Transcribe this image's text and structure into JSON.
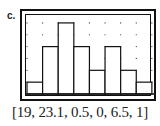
{
  "label": "c.",
  "window_caption": "[19, 23.1, 0.5, 0, 6.5, 1]",
  "chart_data": {
    "type": "bar",
    "subtype": "histogram",
    "title": "",
    "xlabel": "",
    "ylabel": "",
    "window": {
      "xmin": 19,
      "xmax": 23.1,
      "xscl": 0.5,
      "ymin": 0,
      "ymax": 6.5,
      "yscl": 1
    },
    "bin_edges": [
      19,
      19.5,
      20,
      20.5,
      21,
      21.5,
      22,
      22.5,
      23
    ],
    "categories": [
      "19-19.5",
      "19.5-20",
      "20-20.5",
      "20.5-21",
      "21-21.5",
      "21.5-22",
      "22-22.5",
      "22.5-23"
    ],
    "values": [
      1,
      4,
      6,
      4,
      2,
      4,
      2,
      1
    ],
    "grid": "dots",
    "ylim": [
      0,
      6.5
    ],
    "xlim": [
      19,
      23.1
    ]
  },
  "colors": {
    "bar_fill": "#ffffff",
    "bar_stroke": "#111111",
    "frame": "#111111",
    "grid_dot": "#333333"
  }
}
